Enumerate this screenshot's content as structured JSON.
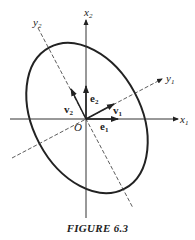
{
  "figure": {
    "caption": "FIGURE 6.3",
    "origin_label": "O",
    "axes": {
      "x1": {
        "label": "x",
        "sub": "1"
      },
      "x2": {
        "label": "x",
        "sub": "2"
      },
      "y1": {
        "label": "y",
        "sub": "1"
      },
      "y2": {
        "label": "y",
        "sub": "2"
      }
    },
    "vectors": {
      "e1": {
        "label": "e",
        "sub": "1"
      },
      "e2": {
        "label": "e",
        "sub": "2"
      },
      "v1": {
        "label": "v",
        "sub": "1"
      },
      "v2": {
        "label": "v",
        "sub": "2"
      }
    },
    "colors": {
      "ink": "#222222",
      "background": "#ffffff"
    }
  }
}
